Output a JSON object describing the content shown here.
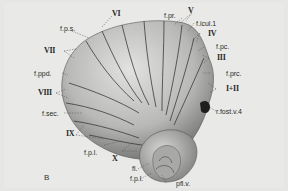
{
  "figure": {
    "panel_label": "B",
    "colors": {
      "background": "#e9e9e7",
      "surface_light": "#d6d6d4",
      "surface_dark": "#7a7a78",
      "fissure_line": "#3a3a3a",
      "label_text": "#2a2a2a"
    },
    "labels": {
      "VI": "VI",
      "fps": "f.p.s.",
      "VII": "VII",
      "fppd": "f.ppd.",
      "VIII": "VIII",
      "fsec": "f.sec.",
      "IX": "IX",
      "fpl_left": "f.p.l.",
      "X": "X",
      "fl": "fl.",
      "fpl_bottom": "f.p.l.",
      "pflv": "pfl.v.",
      "fpr": "f.pr.",
      "V": "V",
      "ficul": "f.icul.1",
      "IV": "IV",
      "fpc": "f.pc.",
      "III": "III",
      "fprc": "f.prc.",
      "I_II": "I+II",
      "rfostv4": "r.fost.v.4"
    }
  }
}
